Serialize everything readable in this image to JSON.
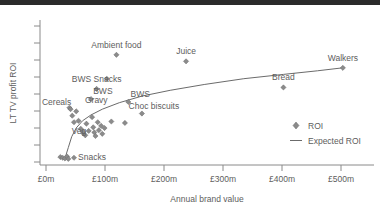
{
  "chart_data": {
    "type": "scatter",
    "title": "",
    "xlabel": "Annual brand value",
    "ylabel": "LT TV profit ROI",
    "xlim": [
      -30,
      560
    ],
    "ylim": [
      0,
      10
    ],
    "grid": false,
    "xticks": [
      0,
      100,
      200,
      300,
      400,
      500
    ],
    "xticklabels": [
      "£0m",
      "£100m",
      "£200m",
      "£300m",
      "£400m",
      "£500m"
    ],
    "yticks": [
      1,
      2,
      3,
      4,
      5,
      6,
      7,
      8,
      9
    ],
    "yticklabels": [
      "",
      "",
      "",
      "",
      "",
      "",
      "",
      "",
      ""
    ],
    "legend_position": "right",
    "legend": [
      {
        "name": "ROI",
        "marker": "diamond"
      },
      {
        "name": "Expected ROI",
        "marker": "line"
      }
    ],
    "series": [
      {
        "name": "ROI",
        "marker": "diamond",
        "color": "#8b8b8b",
        "points": [
          {
            "x": 6,
            "y": 0.55,
            "label": ""
          },
          {
            "x": 10,
            "y": 0.5,
            "label": ""
          },
          {
            "x": 14,
            "y": 0.45,
            "label": ""
          },
          {
            "x": 18,
            "y": 0.58,
            "label": ""
          },
          {
            "x": 20,
            "y": 0.42,
            "label": ""
          },
          {
            "x": 22,
            "y": 3.95,
            "label": ""
          },
          {
            "x": 27,
            "y": 3.4,
            "label": ""
          },
          {
            "x": 30,
            "y": 2.95,
            "label": ""
          },
          {
            "x": 34,
            "y": 3.7,
            "label": ""
          },
          {
            "x": 38,
            "y": 3.05,
            "label": ""
          },
          {
            "x": 42,
            "y": 2.5,
            "label": ""
          },
          {
            "x": 46,
            "y": 2.2,
            "label": ""
          },
          {
            "x": 50,
            "y": 2.05,
            "label": ""
          },
          {
            "x": 52,
            "y": 2.85,
            "label": ""
          },
          {
            "x": 56,
            "y": 2.35,
            "label": ""
          },
          {
            "x": 60,
            "y": 4.55,
            "label": ""
          },
          {
            "x": 62,
            "y": 3.3,
            "label": ""
          },
          {
            "x": 64,
            "y": 2.6,
            "label": ""
          },
          {
            "x": 66,
            "y": 2.25,
            "label": ""
          },
          {
            "x": 68,
            "y": 2.0,
            "label": ""
          },
          {
            "x": 70,
            "y": 5.25,
            "label": ""
          },
          {
            "x": 72,
            "y": 2.95,
            "label": ""
          },
          {
            "x": 74,
            "y": 2.4,
            "label": ""
          },
          {
            "x": 78,
            "y": 2.7,
            "label": ""
          },
          {
            "x": 80,
            "y": 2.15,
            "label": ""
          },
          {
            "x": 84,
            "y": 2.55,
            "label": ""
          },
          {
            "x": 88,
            "y": 5.95,
            "label": ""
          },
          {
            "x": 96,
            "y": 3.0,
            "label": ""
          },
          {
            "x": 120,
            "y": 2.9,
            "label": ""
          },
          {
            "x": 126,
            "y": 4.35,
            "label": "BWS"
          },
          {
            "x": 150,
            "y": 3.55,
            "label": "Choc biscuits"
          },
          {
            "x": 24,
            "y": 3.85,
            "label": "Cereals"
          },
          {
            "x": 46,
            "y": 2.3,
            "label": "Veg"
          },
          {
            "x": 30,
            "y": 0.5,
            "label": "Snacks"
          },
          {
            "x": 70,
            "y": 5.25,
            "label": "BWS Snacks"
          },
          {
            "x": 105,
            "y": 7.6,
            "label": "Ambient food"
          },
          {
            "x": 228,
            "y": 7.15,
            "label": "Juice"
          },
          {
            "x": 400,
            "y": 5.35,
            "label": "Bread"
          },
          {
            "x": 505,
            "y": 6.7,
            "label": "Walkers"
          }
        ]
      }
    ],
    "expected_roi_curve": {
      "name": "Expected ROI",
      "x": [
        14,
        20,
        26,
        34,
        45,
        60,
        80,
        110,
        150,
        200,
        260,
        330,
        400,
        460,
        505
      ],
      "y": [
        0.45,
        1.2,
        1.95,
        2.55,
        3.05,
        3.45,
        3.85,
        4.3,
        4.75,
        5.15,
        5.55,
        5.95,
        6.25,
        6.5,
        6.7
      ]
    },
    "annotations": [
      {
        "text": "Ambient food",
        "x": 105,
        "y": 7.6
      },
      {
        "text": "BWS Snacks",
        "x": 70,
        "y": 5.25
      },
      {
        "text": "Juice",
        "x": 228,
        "y": 7.15
      },
      {
        "text": "Walkers",
        "x": 505,
        "y": 6.7
      },
      {
        "text": "Bread",
        "x": 400,
        "y": 5.35
      },
      {
        "text": "BWS",
        "x": 126,
        "y": 4.35
      },
      {
        "text": "BWS",
        "x": 60,
        "y": 4.55
      },
      {
        "text": "Cereals",
        "x": 24,
        "y": 3.85
      },
      {
        "text": "Gravy",
        "x": 66,
        "y": 3.9
      },
      {
        "text": "Choc biscuits",
        "x": 150,
        "y": 3.55
      },
      {
        "text": "Veg",
        "x": 46,
        "y": 2.3
      },
      {
        "text": "Snacks",
        "x": 30,
        "y": 0.5
      }
    ]
  }
}
